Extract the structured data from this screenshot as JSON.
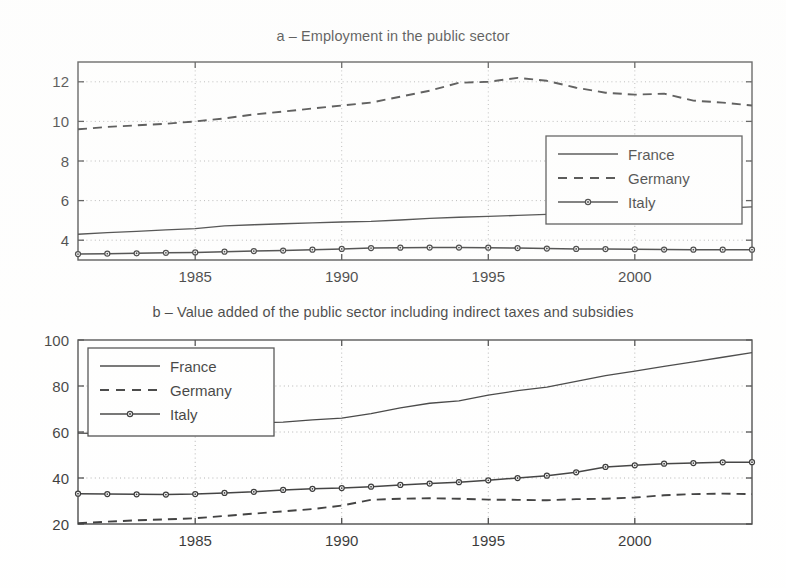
{
  "figure": {
    "background": "#ffffff",
    "ink": "#1a1a1a"
  },
  "panel_a": {
    "title": "a – Employment in the public sector",
    "legend": {
      "position": "bottom-right",
      "entries": [
        {
          "label": "France",
          "style": "solid"
        },
        {
          "label": "Germany",
          "style": "dashed"
        },
        {
          "label": "Italy",
          "style": "solid-marker"
        }
      ]
    },
    "axis": {
      "x_ticks": [
        "1985",
        "1990",
        "1995",
        "2000"
      ],
      "y_ticks": [
        "4",
        "6",
        "8",
        "10",
        "12"
      ]
    }
  },
  "panel_b": {
    "title": "b – Value added of the public sector including indirect taxes and subsidies",
    "legend": {
      "position": "top-left",
      "entries": [
        {
          "label": "France",
          "style": "solid"
        },
        {
          "label": "Germany",
          "style": "dashed"
        },
        {
          "label": "Italy",
          "style": "solid-marker"
        }
      ]
    },
    "axis": {
      "x_ticks": [
        "1985",
        "1990",
        "1995",
        "2000"
      ],
      "y_ticks": [
        "20",
        "40",
        "60",
        "80",
        "100"
      ]
    }
  },
  "chart_data": [
    {
      "type": "line",
      "id": "panel-a",
      "title": "a – Employment in the public sector",
      "xlabel": "",
      "ylabel": "",
      "xlim": [
        1981,
        2004
      ],
      "ylim": [
        3.0,
        13.0
      ],
      "xticks": [
        1985,
        1990,
        1995,
        2000
      ],
      "yticks": [
        4,
        6,
        8,
        10,
        12
      ],
      "grid": true,
      "grid_style": "dotted",
      "legend_position": "bottom-right",
      "x": [
        1981,
        1982,
        1983,
        1984,
        1985,
        1986,
        1987,
        1988,
        1989,
        1990,
        1991,
        1992,
        1993,
        1994,
        1995,
        1996,
        1997,
        1998,
        1999,
        2000,
        2001,
        2002,
        2003,
        2004
      ],
      "series": [
        {
          "name": "France",
          "style": "solid",
          "marker": "none",
          "values": [
            4.3,
            4.38,
            4.45,
            4.52,
            4.58,
            4.72,
            4.78,
            4.83,
            4.88,
            4.92,
            4.95,
            5.02,
            5.1,
            5.16,
            5.2,
            5.25,
            5.3,
            5.34,
            5.38,
            5.42,
            5.47,
            5.54,
            5.62,
            5.68
          ]
        },
        {
          "name": "Germany",
          "style": "dashed",
          "marker": "none",
          "values": [
            9.6,
            9.72,
            9.8,
            9.88,
            10.0,
            10.15,
            10.35,
            10.5,
            10.65,
            10.8,
            10.95,
            11.25,
            11.55,
            11.95,
            12.0,
            12.2,
            12.05,
            11.7,
            11.45,
            11.35,
            11.4,
            11.05,
            10.95,
            10.8
          ]
        },
        {
          "name": "Italy",
          "style": "solid",
          "marker": "circle",
          "values": [
            3.3,
            3.32,
            3.34,
            3.36,
            3.38,
            3.42,
            3.45,
            3.48,
            3.52,
            3.56,
            3.6,
            3.62,
            3.63,
            3.63,
            3.62,
            3.6,
            3.58,
            3.56,
            3.55,
            3.54,
            3.53,
            3.52,
            3.52,
            3.52
          ]
        }
      ]
    },
    {
      "type": "line",
      "id": "panel-b",
      "title": "b – Value added of the public sector including indirect taxes and subsidies",
      "xlabel": "",
      "ylabel": "",
      "xlim": [
        1981,
        2004
      ],
      "ylim": [
        20,
        100
      ],
      "xticks": [
        1985,
        1990,
        1995,
        2000
      ],
      "yticks": [
        20,
        40,
        60,
        80,
        100
      ],
      "grid": true,
      "grid_style": "dotted",
      "legend_position": "top-left",
      "x": [
        1981,
        1982,
        1983,
        1984,
        1985,
        1986,
        1987,
        1988,
        1989,
        1990,
        1991,
        1992,
        1993,
        1994,
        1995,
        1996,
        1997,
        1998,
        1999,
        2000,
        2001,
        2002,
        2003,
        2004
      ],
      "series": [
        {
          "name": "France",
          "style": "solid",
          "marker": "none",
          "values": [
            59.5,
            59.3,
            60.5,
            62.0,
            63.0,
            63.2,
            64.0,
            64.3,
            65.3,
            66.0,
            68.0,
            70.5,
            72.5,
            73.5,
            76.0,
            78.0,
            79.5,
            82.0,
            84.5,
            86.5,
            88.5,
            90.5,
            92.5,
            94.5
          ]
        },
        {
          "name": "Germany",
          "style": "dashed",
          "marker": "none",
          "values": [
            20.3,
            21.0,
            21.6,
            22.0,
            22.5,
            23.5,
            24.5,
            25.5,
            26.5,
            28.0,
            30.5,
            31.0,
            31.2,
            31.0,
            30.6,
            30.5,
            30.3,
            30.8,
            31.0,
            31.5,
            32.5,
            33.0,
            33.2,
            33.0
          ]
        },
        {
          "name": "Italy",
          "style": "solid",
          "marker": "circle",
          "values": [
            33.2,
            33.0,
            32.9,
            32.8,
            33.0,
            33.5,
            34.0,
            34.8,
            35.3,
            35.6,
            36.2,
            37.0,
            37.6,
            38.2,
            39.0,
            40.0,
            41.0,
            42.5,
            44.8,
            45.5,
            46.2,
            46.5,
            46.8,
            46.9
          ]
        }
      ]
    }
  ]
}
